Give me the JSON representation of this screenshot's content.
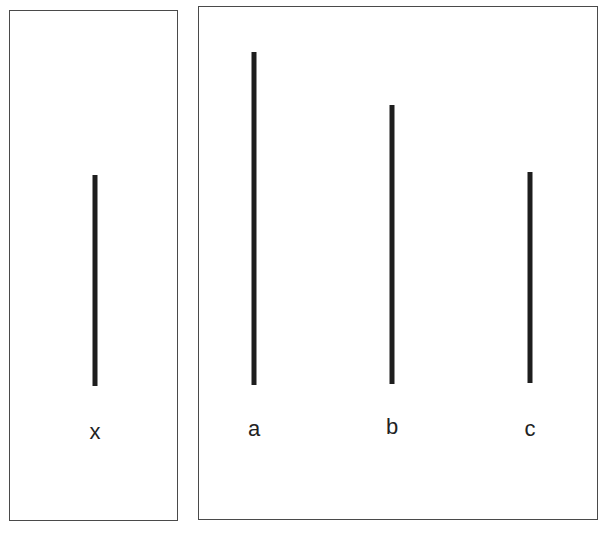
{
  "figure": {
    "colors": {
      "line": "#1e1e1e",
      "border": "#4a4a4a",
      "label": "#222222",
      "background": "#ffffff"
    }
  },
  "standard_panel": {
    "line": {
      "label": "x",
      "x": 95,
      "top": 175,
      "bottom": 386,
      "length_px": 211
    }
  },
  "comparison_panel": {
    "lines": [
      {
        "label": "a",
        "x": 254,
        "top": 52,
        "bottom": 385,
        "length_px": 333
      },
      {
        "label": "b",
        "x": 392,
        "top": 105,
        "bottom": 384,
        "length_px": 279
      },
      {
        "label": "c",
        "x": 530,
        "top": 172,
        "bottom": 383,
        "length_px": 211
      }
    ]
  }
}
